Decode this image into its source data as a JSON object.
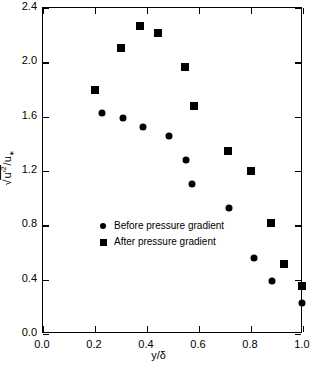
{
  "chart_data": {
    "type": "scatter",
    "title": "",
    "xlabel": "y/δ",
    "ylabel": "√(u'²)/u∗",
    "xlim": [
      0.0,
      1.0
    ],
    "ylim": [
      0.0,
      2.4
    ],
    "xticks": [
      "0.0",
      "0.2",
      "0.4",
      "0.6",
      "0.8",
      "1.0"
    ],
    "xtickvals": [
      0.0,
      0.2,
      0.4,
      0.6,
      0.8,
      1.0
    ],
    "yticks": [
      "0.0",
      "0.4",
      "0.8",
      "1.2",
      "1.6",
      "2.0",
      "2.4"
    ],
    "ytickvals": [
      0.0,
      0.4,
      0.8,
      1.2,
      1.6,
      2.0,
      2.4
    ],
    "grid": false,
    "legend_position": "center-left",
    "series": [
      {
        "name": "Before pressure gradient",
        "marker": "circle",
        "color": "#000000",
        "points": [
          {
            "x": 0.23,
            "y": 1.62
          },
          {
            "x": 0.31,
            "y": 1.58
          },
          {
            "x": 0.39,
            "y": 1.52
          },
          {
            "x": 0.49,
            "y": 1.45
          },
          {
            "x": 0.555,
            "y": 1.27
          },
          {
            "x": 0.575,
            "y": 1.1
          },
          {
            "x": 0.72,
            "y": 0.92
          },
          {
            "x": 0.815,
            "y": 0.55
          },
          {
            "x": 0.885,
            "y": 0.385
          },
          {
            "x": 1.0,
            "y": 0.22
          }
        ]
      },
      {
        "name": "After pressure gradient",
        "marker": "square",
        "color": "#000000",
        "points": [
          {
            "x": 0.205,
            "y": 1.79
          },
          {
            "x": 0.305,
            "y": 2.1
          },
          {
            "x": 0.375,
            "y": 2.26
          },
          {
            "x": 0.445,
            "y": 2.21
          },
          {
            "x": 0.55,
            "y": 1.96
          },
          {
            "x": 0.585,
            "y": 1.67
          },
          {
            "x": 0.715,
            "y": 1.34
          },
          {
            "x": 0.805,
            "y": 1.19
          },
          {
            "x": 0.88,
            "y": 0.81
          },
          {
            "x": 0.93,
            "y": 0.51
          },
          {
            "x": 1.0,
            "y": 0.345
          }
        ]
      }
    ]
  },
  "legend": {
    "items": [
      {
        "label": "Before pressure gradient",
        "marker": "circle"
      },
      {
        "label": "After pressure gradient",
        "marker": "square"
      }
    ]
  }
}
